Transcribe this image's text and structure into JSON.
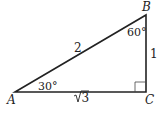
{
  "diagram": {
    "type": "right-triangle",
    "vertices": {
      "A": {
        "label": "A",
        "x": 15,
        "y": 92
      },
      "B": {
        "label": "B",
        "x": 146,
        "y": 15
      },
      "C": {
        "label": "C",
        "x": 146,
        "y": 92
      }
    },
    "angles": {
      "A": "30°",
      "B": "60°",
      "C": "right-angle"
    },
    "sides": {
      "AB": "2",
      "BC": "1",
      "AC_radicand": "3"
    },
    "colors": {
      "stroke": "#222222",
      "background": "#ffffff"
    }
  }
}
